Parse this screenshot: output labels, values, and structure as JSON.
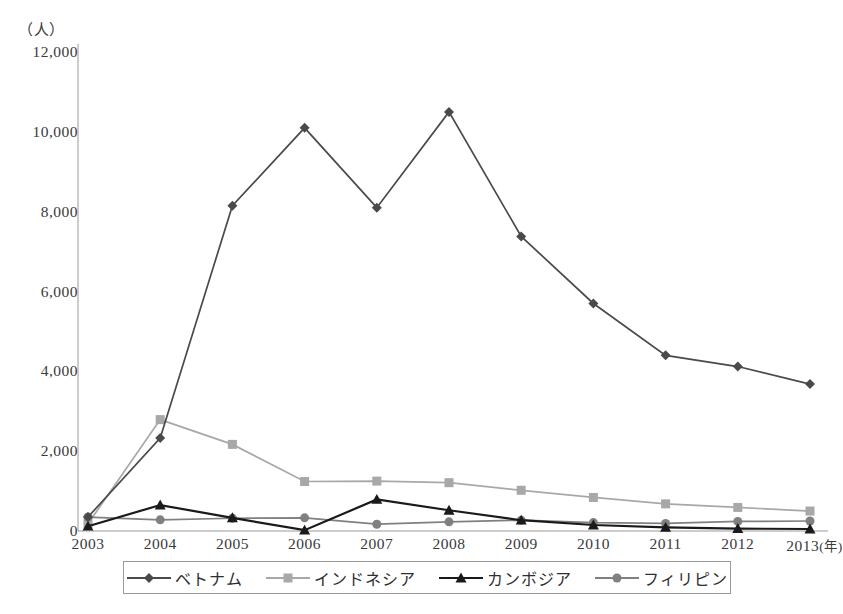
{
  "title_clipped": "外国人技能実習生の国籍別推移",
  "unit_label": "（人）",
  "axis": {
    "x_unit_label": "(年)",
    "y_unit_label": "（人）"
  },
  "colors": {
    "vietnam": "#4a4a4a",
    "indonesia": "#a8a8a8",
    "cambodia": "#1a1a1a",
    "philippines": "#808080",
    "axis": "#9a9a9a",
    "text": "#3a3a3a"
  },
  "legend": {
    "position": "bottom",
    "items": [
      {
        "label": "ベトナム",
        "marker": "diamond",
        "color": "#4a4a4a"
      },
      {
        "label": "インドネシア",
        "marker": "square",
        "color": "#a8a8a8"
      },
      {
        "label": "カンボジア",
        "marker": "triangle",
        "color": "#1a1a1a"
      },
      {
        "label": "フィリピン",
        "marker": "circle",
        "color": "#808080"
      }
    ]
  },
  "chart_data": {
    "type": "line",
    "title": "外国人技能実習生の国籍別推移",
    "xlabel": "(年)",
    "ylabel": "（人）",
    "categories": [
      "2003",
      "2004",
      "2005",
      "2006",
      "2007",
      "2008",
      "2009",
      "2010",
      "2011",
      "2012",
      "2013"
    ],
    "xtick_labels": [
      "2003",
      "2004",
      "2005",
      "2006",
      "2007",
      "2008",
      "2009",
      "2010",
      "2011",
      "2012",
      "2013"
    ],
    "ytick_labels": [
      "0",
      "2,000",
      "4,000",
      "6,000",
      "8,000",
      "10,000",
      "12,000"
    ],
    "ytick_values": [
      0,
      2000,
      4000,
      6000,
      8000,
      10000,
      12000
    ],
    "ylim": [
      0,
      12000
    ],
    "grid": false,
    "legend_position": "bottom",
    "series": [
      {
        "name": "ベトナム",
        "marker": "diamond",
        "color": "#4a4a4a",
        "values": [
          350,
          2330,
          8150,
          10100,
          8100,
          10500,
          7380,
          5700,
          4400,
          4120,
          3680
        ]
      },
      {
        "name": "インドネシア",
        "marker": "square",
        "color": "#a8a8a8",
        "values": [
          180,
          2790,
          2170,
          1240,
          1250,
          1210,
          1020,
          840,
          680,
          590,
          500
        ]
      },
      {
        "name": "カンボジア",
        "marker": "triangle",
        "color": "#1a1a1a",
        "values": [
          120,
          650,
          330,
          20,
          790,
          520,
          270,
          150,
          90,
          60,
          50
        ]
      },
      {
        "name": "フィリピン",
        "marker": "circle",
        "color": "#808080",
        "values": [
          350,
          280,
          320,
          330,
          170,
          230,
          270,
          210,
          190,
          240,
          250
        ]
      }
    ]
  }
}
